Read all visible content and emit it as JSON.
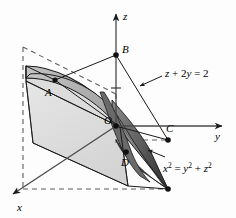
{
  "figure": {
    "kind": "3d-coordinate-diagram",
    "background_color": "#fdfdfd"
  },
  "axes": [
    {
      "id": "z",
      "label": "z",
      "direction": "up",
      "interactable": false
    },
    {
      "id": "y",
      "label": "y",
      "direction": "right",
      "interactable": false
    },
    {
      "id": "x",
      "label": "x",
      "direction": "down-left",
      "interactable": false
    }
  ],
  "points": [
    {
      "id": "A",
      "label": "A"
    },
    {
      "id": "B",
      "label": "B"
    },
    {
      "id": "C",
      "label": "C"
    },
    {
      "id": "D",
      "label": "D"
    },
    {
      "id": "O",
      "label": "O"
    }
  ],
  "equations": {
    "plane": {
      "id": "plane-equation",
      "text": "z + 2y = 2",
      "parts": [
        {
          "t": "z",
          "style": "var"
        },
        {
          "t": " + 2",
          "style": "plain"
        },
        {
          "t": "y",
          "style": "var"
        },
        {
          "t": " = 2",
          "style": "plain"
        }
      ]
    },
    "cone": {
      "id": "cone-equation",
      "text": "x2 = y2 + z2",
      "parts": [
        {
          "t": "x",
          "style": "var"
        },
        {
          "t": "2",
          "style": "sup"
        },
        {
          "t": " = ",
          "style": "plain"
        },
        {
          "t": "y",
          "style": "var"
        },
        {
          "t": "2",
          "style": "sup"
        },
        {
          "t": " + ",
          "style": "plain"
        },
        {
          "t": "z",
          "style": "var"
        },
        {
          "t": "2",
          "style": "sup"
        }
      ]
    }
  },
  "colors": {
    "stroke": "#1a1a1a",
    "plane_fill": "#dedede",
    "cone_light_fill": "#b9b9b9",
    "cone_mid_fill": "#8f8f8f",
    "cone_dark_fill": "#585858",
    "cone_darkest_fill": "#3f3f3f",
    "axis": "#555555",
    "dashed": "#6e6e6e"
  }
}
